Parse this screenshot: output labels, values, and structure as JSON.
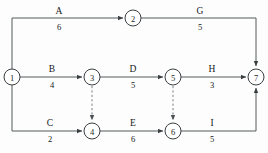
{
  "diagram": {
    "kind": "activity-on-arrow-network",
    "colors": {
      "edge": "#555a5c",
      "dummy": "#7a7f82",
      "node_stroke": "#3a3f42",
      "node_fill": "#ffffff",
      "text": "#15181a",
      "background": "#fdfdfd"
    },
    "nodes": [
      {
        "id": "1",
        "label": "1",
        "cx": 12,
        "cy": 77
      },
      {
        "id": "2",
        "label": "2",
        "cx": 133,
        "cy": 18
      },
      {
        "id": "3",
        "label": "3",
        "cx": 92,
        "cy": 77
      },
      {
        "id": "4",
        "label": "4",
        "cx": 92,
        "cy": 131
      },
      {
        "id": "5",
        "label": "5",
        "cx": 173,
        "cy": 77
      },
      {
        "id": "6",
        "label": "6",
        "cx": 173,
        "cy": 131
      },
      {
        "id": "7",
        "label": "7",
        "cx": 256,
        "cy": 77
      }
    ],
    "node_radius": 8,
    "edges": [
      {
        "name": "A",
        "duration": "6",
        "from": "1",
        "to": "2",
        "label_x": 59,
        "name_y": 14,
        "dur_y": 30
      },
      {
        "name": "G",
        "duration": "5",
        "from": "2",
        "to": "7",
        "label_x": 200,
        "name_y": 14,
        "dur_y": 30
      },
      {
        "name": "B",
        "duration": "4",
        "from": "1",
        "to": "3",
        "label_x": 52,
        "name_y": 72,
        "dur_y": 88
      },
      {
        "name": "D",
        "duration": "5",
        "from": "3",
        "to": "5",
        "label_x": 133,
        "name_y": 72,
        "dur_y": 88
      },
      {
        "name": "H",
        "duration": "3",
        "from": "5",
        "to": "7",
        "label_x": 212,
        "name_y": 72,
        "dur_y": 88
      },
      {
        "name": "C",
        "duration": "2",
        "from": "1",
        "to": "4",
        "label_x": 50,
        "name_y": 126,
        "dur_y": 142
      },
      {
        "name": "E",
        "duration": "6",
        "from": "4",
        "to": "6",
        "label_x": 133,
        "name_y": 126,
        "dur_y": 142
      },
      {
        "name": "I",
        "duration": "5",
        "from": "6",
        "to": "7",
        "label_x": 212,
        "name_y": 126,
        "dur_y": 142
      }
    ],
    "dummy_edges": [
      {
        "from": "3",
        "to": "4"
      },
      {
        "from": "5",
        "to": "6"
      }
    ]
  }
}
